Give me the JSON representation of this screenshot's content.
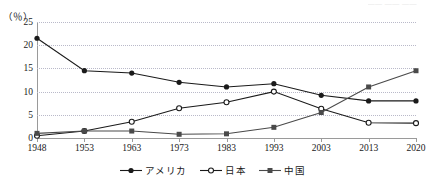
{
  "header": {
    "corner_note": "—— —— ——"
  },
  "axis": {
    "unit_label": "（％）",
    "y_ticks": [
      "0",
      "5",
      "10",
      "15",
      "20",
      "25"
    ],
    "x_ticks": [
      "1948",
      "1953",
      "1963",
      "1973",
      "1983",
      "1993",
      "2003",
      "2013",
      "2020"
    ]
  },
  "legend": {
    "items": [
      {
        "label": "アメリカ",
        "marker": "filled-circle-marker",
        "color": "#1a1a1a"
      },
      {
        "label": "日本",
        "marker": "open-circle-marker",
        "color": "#1a1a1a"
      },
      {
        "label": "中国",
        "marker": "filled-square-marker",
        "color": "#4a4a4a"
      }
    ]
  },
  "chart_data": {
    "type": "line",
    "title": "",
    "xlabel": "",
    "ylabel": "（％）",
    "categories": [
      "1948",
      "1953",
      "1963",
      "1973",
      "1983",
      "1993",
      "2003",
      "2013",
      "2020"
    ],
    "x": [
      1948,
      1953,
      1963,
      1973,
      1983,
      1993,
      2003,
      2013,
      2020
    ],
    "ylim": [
      0,
      25
    ],
    "yticks": [
      0,
      5,
      10,
      15,
      20,
      25
    ],
    "grid": true,
    "legend_position": "bottom-center",
    "series": [
      {
        "name": "アメリカ",
        "marker": "filled-circle",
        "color": "#1a1a1a",
        "values": [
          21.5,
          14.5,
          14.0,
          12.0,
          11.0,
          11.7,
          9.2,
          8.0,
          8.0
        ]
      },
      {
        "name": "日本",
        "marker": "open-circle",
        "color": "#1a1a1a",
        "values": [
          0.5,
          1.5,
          3.5,
          6.4,
          7.7,
          10.0,
          6.3,
          3.3,
          3.2
        ]
      },
      {
        "name": "中国",
        "marker": "filled-square",
        "color": "#4a4a4a",
        "values": [
          1.0,
          1.5,
          1.5,
          0.8,
          0.9,
          2.3,
          5.5,
          11.0,
          14.5
        ]
      }
    ]
  }
}
